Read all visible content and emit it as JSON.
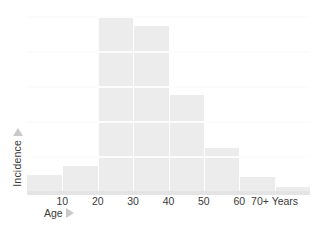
{
  "chart_data": {
    "type": "bar",
    "title": "",
    "subtitle": "",
    "xlabel": "Age",
    "ylabel": "Incidence",
    "xunit_label": "Years",
    "categories": [
      "0-10",
      "10-20",
      "20-30",
      "30-40",
      "40-50",
      "50-60",
      "60-70",
      "70+"
    ],
    "tick_labels": [
      "10",
      "20",
      "30",
      "40",
      "50",
      "60",
      "70+ Years"
    ],
    "values": [
      9,
      14,
      96,
      91,
      53,
      24,
      8,
      2
    ],
    "ylim": [
      0,
      100
    ],
    "xlim": [
      0,
      80
    ],
    "grid": true,
    "grid_axis": "y",
    "legend": null,
    "annotations": [],
    "axis_arrows": {
      "x": "right-triangle",
      "y": "up-triangle"
    }
  },
  "style": {
    "bar_color": "#ececec",
    "gridline_color": "#fcfcfc",
    "baseline_color": "#e4e4e4",
    "text_color": "#3a3a3a",
    "arrow_color": "#c9c9c9",
    "background": "#ffffff"
  },
  "icons": {
    "x_axis_arrow": "triangle-right-icon",
    "y_axis_arrow": "triangle-up-icon"
  }
}
